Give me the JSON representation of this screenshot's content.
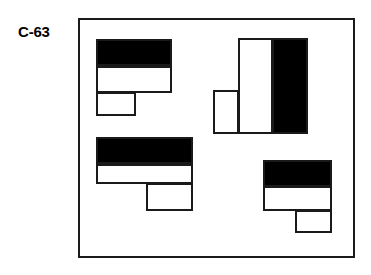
{
  "page": {
    "title": "C-63",
    "background_color": "#ffffff",
    "width": 371,
    "height": 275
  },
  "label": {
    "text": "C-63",
    "x": 18,
    "y": 24,
    "color": "#000000"
  },
  "panel": {
    "name": "test-item-panel",
    "x": 78,
    "y": 18,
    "width": 277,
    "height": 240,
    "border_color": "#1a1a1a",
    "border_width": 2,
    "fill": "#ffffff"
  },
  "colors": {
    "ink": "#1a1a1a",
    "black_fill": "#000000",
    "white_fill": "#ffffff",
    "paper": "#ffffff"
  },
  "figures": [
    {
      "id": "figure-top-left",
      "orientation": "step-down-left",
      "parts": [
        {
          "id": "black-band",
          "fill": "black",
          "x": 96,
          "y": 39,
          "width": 76,
          "height": 27
        },
        {
          "id": "white-band",
          "fill": "white",
          "x": 96,
          "y": 66,
          "width": 76,
          "height": 27
        },
        {
          "id": "white-foot",
          "fill": "white",
          "x": 96,
          "y": 92,
          "width": 40,
          "height": 24
        }
      ]
    },
    {
      "id": "figure-top-right",
      "orientation": "rotated-90-step-left",
      "parts": [
        {
          "id": "white-band",
          "fill": "white",
          "x": 238,
          "y": 38,
          "width": 35,
          "height": 96
        },
        {
          "id": "black-band",
          "fill": "black",
          "x": 272,
          "y": 38,
          "width": 36,
          "height": 96
        },
        {
          "id": "white-foot",
          "fill": "white",
          "x": 213,
          "y": 90,
          "width": 26,
          "height": 44
        }
      ]
    },
    {
      "id": "figure-bottom-left",
      "orientation": "step-down-right",
      "parts": [
        {
          "id": "black-band",
          "fill": "black",
          "x": 96,
          "y": 137,
          "width": 97,
          "height": 27
        },
        {
          "id": "white-band",
          "fill": "white",
          "x": 96,
          "y": 164,
          "width": 97,
          "height": 20
        },
        {
          "id": "white-foot",
          "fill": "white",
          "x": 146,
          "y": 183,
          "width": 47,
          "height": 28
        }
      ]
    },
    {
      "id": "figure-bottom-right",
      "orientation": "step-down-right",
      "parts": [
        {
          "id": "black-band",
          "fill": "black",
          "x": 263,
          "y": 160,
          "width": 69,
          "height": 27
        },
        {
          "id": "white-band",
          "fill": "white",
          "x": 263,
          "y": 186,
          "width": 69,
          "height": 25
        },
        {
          "id": "white-foot",
          "fill": "white",
          "x": 295,
          "y": 210,
          "width": 37,
          "height": 23
        }
      ]
    }
  ]
}
